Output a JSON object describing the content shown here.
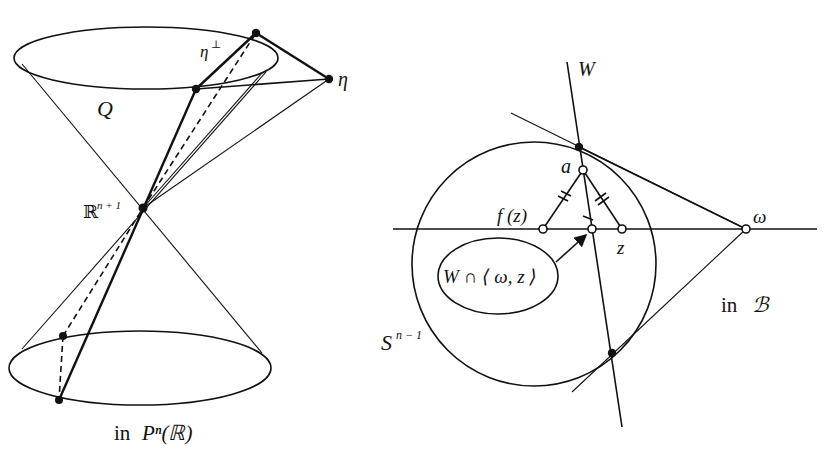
{
  "figure": {
    "left_panel": {
      "caption": "in Pⁿ(ℝ)",
      "caption_prefix": "in",
      "caption_math": "Pⁿ(ℝ)",
      "labels": {
        "quadric": "Q",
        "apex": "ℝⁿ⁺¹",
        "apex_base": "ℝ",
        "apex_sup": "n + 1",
        "eta": "η",
        "eta_perp": "η",
        "eta_perp_sup": "⊥"
      }
    },
    "right_panel": {
      "caption": "in ℬ",
      "caption_prefix": "in",
      "caption_math": "ℬ",
      "labels": {
        "W": "W",
        "a": "a",
        "f_z": "f (z)",
        "z": "z",
        "omega": "ω",
        "sphere": "S",
        "sphere_sup": "n − 1",
        "callout": "W ∩ ⟨ ω, z ⟩"
      }
    }
  }
}
